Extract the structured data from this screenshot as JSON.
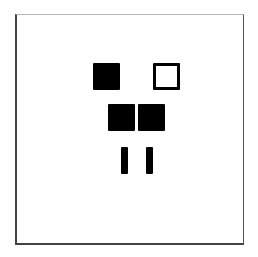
{
  "figure": {
    "frame": {
      "x": 15,
      "y": 14,
      "width": 229,
      "height": 231
    },
    "colors": {
      "ink": "#000000",
      "background": "#ffffff",
      "frame": "#444444"
    },
    "shapes": [
      {
        "id": "square-top-left",
        "type": "filled-square",
        "x": 93,
        "y": 63,
        "width": 27,
        "height": 27
      },
      {
        "id": "square-top-right",
        "type": "outline-square",
        "x": 153,
        "y": 63,
        "width": 27,
        "height": 27
      },
      {
        "id": "square-middle-left",
        "type": "filled-square",
        "x": 108,
        "y": 104,
        "width": 27,
        "height": 27
      },
      {
        "id": "square-middle-right",
        "type": "filled-square",
        "x": 138,
        "y": 104,
        "width": 27,
        "height": 27
      },
      {
        "id": "bar-bottom-left",
        "type": "filled-bar",
        "x": 121,
        "y": 147,
        "width": 7,
        "height": 27
      },
      {
        "id": "bar-bottom-right",
        "type": "filled-bar",
        "x": 146,
        "y": 147,
        "width": 7,
        "height": 27
      }
    ]
  }
}
